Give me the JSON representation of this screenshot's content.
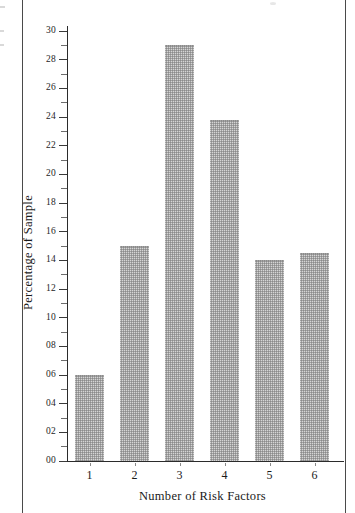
{
  "chart_data": {
    "type": "bar",
    "title": "",
    "subtitle": "",
    "xlabel": "Number of Risk Factors",
    "ylabel": "Percentage of Sample",
    "categories": [
      "1",
      "2",
      "3",
      "4",
      "5",
      "6"
    ],
    "values": [
      6.0,
      15.0,
      29.0,
      23.8,
      14.0,
      14.5
    ],
    "ylim": [
      0,
      30
    ],
    "ytick_step": 2,
    "ytick_labels": [
      "00",
      "02",
      "04",
      "06",
      "08",
      "10",
      "12",
      "14",
      "16",
      "18",
      "20",
      "22",
      "24",
      "26",
      "28",
      "30"
    ],
    "ytick_values": [
      0,
      2,
      4,
      6,
      8,
      10,
      12,
      14,
      16,
      18,
      20,
      22,
      24,
      26,
      28,
      30
    ],
    "minor_ticks": true,
    "minor_tick_step": 1,
    "grid": false,
    "legend": null,
    "legend_position": "none",
    "annotations": [],
    "bar_fill_color": "#d5d5d5",
    "bar_pattern": "fine-dither-checkerboard",
    "axis_color": "#2b2b2b",
    "background_color": "#ffffff"
  },
  "page": {
    "left_rule": "page-edge-rule",
    "right_rule": "page-edge-rule"
  }
}
